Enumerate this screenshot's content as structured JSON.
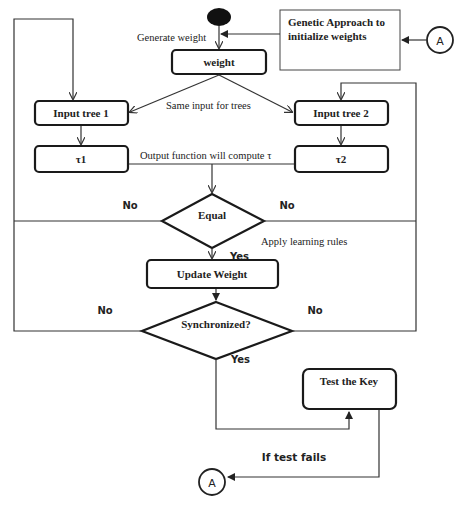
{
  "diagram": {
    "type": "flowchart",
    "nodes": {
      "start": {
        "shape": "ellipse-filled"
      },
      "genetic": {
        "label_line1": "Genetic Approach to",
        "label_line2": "initialize weights"
      },
      "connector_top": {
        "label": "A"
      },
      "weight": {
        "label": "weight"
      },
      "input_tree_1": {
        "label": "Input tree 1"
      },
      "input_tree_2": {
        "label": "Input tree 2"
      },
      "tau1": {
        "label": "τ1"
      },
      "tau2": {
        "label": "τ2"
      },
      "equal": {
        "label": "Equal"
      },
      "update_weight": {
        "label": "Update Weight"
      },
      "synchronized": {
        "label": "Synchronized?"
      },
      "test_key": {
        "label": "Test the Key"
      },
      "connector_bottom": {
        "label": "A"
      }
    },
    "edge_labels": {
      "generate_weight": "Generate weight",
      "same_input": "Same input for trees",
      "output_function": "Output function will compute  τ",
      "equal_no_left": "No",
      "equal_no_right": "No",
      "apply_learning": "Apply learning rules",
      "equal_yes": "Yes",
      "sync_no_left": "No",
      "sync_no_right": "No",
      "sync_yes": "Yes",
      "test_fails": "If test fails"
    }
  }
}
